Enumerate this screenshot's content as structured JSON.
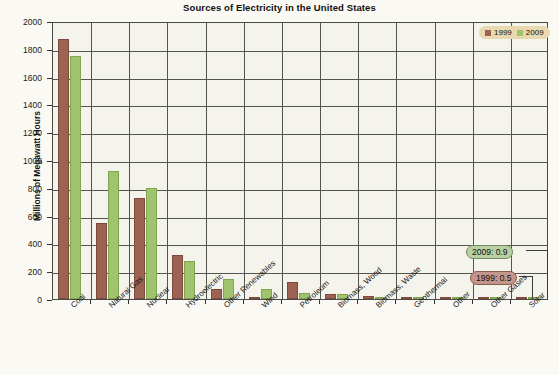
{
  "chart_data": {
    "type": "bar",
    "title": "Sources of Electricity in the United States",
    "xlabel": "",
    "ylabel": "Millions of Megawatt Hours",
    "ylim": [
      0,
      2000
    ],
    "ytick_step": 200,
    "yticks": [
      0,
      200,
      400,
      600,
      800,
      1000,
      1200,
      1400,
      1600,
      1800,
      2000
    ],
    "grid": true,
    "legend_position": "top-right",
    "categories": [
      "Coal",
      "Natural Gas",
      "Nuclear",
      "Hydroelectric",
      "Other Renewables",
      "Wind",
      "Petroleum",
      "Biomass, Wood",
      "Biomass, Waste",
      "Geothermal",
      "Other",
      "Other Gases",
      "Solar"
    ],
    "series": [
      {
        "name": "1999",
        "color": "#9d6352",
        "values": [
          1870,
          550,
          725,
          320,
          70,
          4,
          125,
          37,
          20,
          15,
          5,
          10,
          0.5
        ]
      },
      {
        "name": "2009",
        "color": "#9fc46d",
        "values": [
          1750,
          920,
          800,
          270,
          145,
          74,
          40,
          36,
          18,
          15,
          12,
          11,
          0.9
        ]
      }
    ],
    "annotations": [
      {
        "label": "2009: 0.9",
        "series": "2009",
        "category": "Solar",
        "value": 0.9
      },
      {
        "label": "1999: 0.5",
        "series": "1999",
        "category": "Solar",
        "value": 0.5
      }
    ]
  },
  "legend": {
    "items": [
      {
        "label": "1999"
      },
      {
        "label": "2009"
      }
    ]
  }
}
